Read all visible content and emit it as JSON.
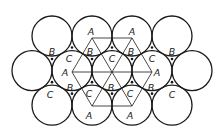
{
  "diagram": {
    "title": "",
    "stroke_color": "#1a1a1a",
    "background": "#ffffff",
    "radius": 20,
    "circles": [
      {
        "x": 52,
        "y": 36
      },
      {
        "x": 92,
        "y": 36
      },
      {
        "x": 132,
        "y": 36
      },
      {
        "x": 172,
        "y": 36
      },
      {
        "x": 32,
        "y": 70.6
      },
      {
        "x": 72,
        "y": 70.6
      },
      {
        "x": 112,
        "y": 70.6
      },
      {
        "x": 152,
        "y": 70.6
      },
      {
        "x": 192,
        "y": 70.6
      },
      {
        "x": 52,
        "y": 105.2
      },
      {
        "x": 92,
        "y": 105.2
      },
      {
        "x": 132,
        "y": 105.2
      },
      {
        "x": 172,
        "y": 105.2
      }
    ],
    "labels": [
      {
        "text": "A",
        "x": 91,
        "y": 31
      },
      {
        "text": "A",
        "x": 132,
        "y": 31
      },
      {
        "text": "B",
        "x": 52,
        "y": 51
      },
      {
        "text": "B",
        "x": 90,
        "y": 51
      },
      {
        "text": "B",
        "x": 131,
        "y": 51
      },
      {
        "text": "B",
        "x": 172,
        "y": 51
      },
      {
        "text": "C",
        "x": 69,
        "y": 58
      },
      {
        "text": "C",
        "x": 112,
        "y": 58
      },
      {
        "text": "C",
        "x": 152,
        "y": 58
      },
      {
        "text": "A",
        "x": 65,
        "y": 72
      },
      {
        "text": "A",
        "x": 157,
        "y": 72
      },
      {
        "text": "B",
        "x": 70,
        "y": 87
      },
      {
        "text": "B",
        "x": 111,
        "y": 87
      },
      {
        "text": "B",
        "x": 151,
        "y": 87
      },
      {
        "text": "C",
        "x": 50,
        "y": 94
      },
      {
        "text": "C",
        "x": 89,
        "y": 93
      },
      {
        "text": "C",
        "x": 130,
        "y": 93
      },
      {
        "text": "C",
        "x": 172,
        "y": 94
      },
      {
        "text": "A",
        "x": 89,
        "y": 115
      },
      {
        "text": "A",
        "x": 130,
        "y": 115
      }
    ]
  }
}
